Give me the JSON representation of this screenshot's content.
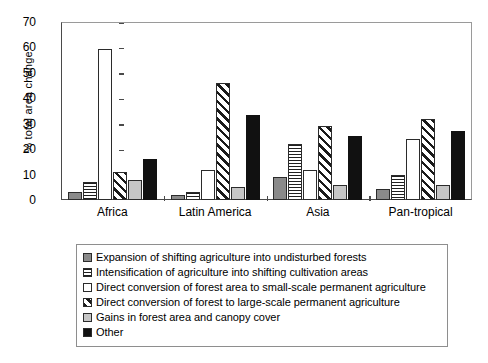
{
  "chart_data": {
    "type": "bar",
    "title": "",
    "xlabel": "",
    "ylabel": "% total area change",
    "ylim": [
      0,
      70
    ],
    "ytick_step": 10,
    "yticks": [
      70,
      60,
      50,
      40,
      30,
      20,
      10,
      0
    ],
    "grid": false,
    "legend_position": "below-plot",
    "categories": [
      "Africa",
      "Latin America",
      "Asia",
      "Pan-tropical"
    ],
    "series": [
      {
        "name": "Expansion of shifting agriculture into undisturbed forests",
        "pattern": "solid-dark-gray",
        "color": "#8a8a8a",
        "values": [
          3,
          2,
          9,
          4.5
        ]
      },
      {
        "name": "Intensification of agriculture into shifting cultivation areas",
        "pattern": "horizontal-lines",
        "color": "#202020",
        "values": [
          7,
          3,
          22,
          10
        ]
      },
      {
        "name": "Direct conversion of forest area to small-scale permanent agriculture",
        "pattern": "solid-white",
        "color": "#ffffff",
        "values": [
          59.5,
          12,
          12,
          24
        ]
      },
      {
        "name": "Direct conversion of forest to large-scale permanent agriculture",
        "pattern": "diagonal-hatch",
        "color": "#1a1a1a",
        "values": [
          11,
          46,
          29,
          32
        ]
      },
      {
        "name": "Gains in forest area and canopy cover",
        "pattern": "solid-light-gray",
        "color": "#c6c6c6",
        "values": [
          8,
          5,
          6,
          6
        ]
      },
      {
        "name": "Other",
        "pattern": "solid-black",
        "color": "#111111",
        "values": [
          16,
          33.5,
          25,
          27
        ]
      }
    ]
  },
  "axis": {
    "y_title": "% total area change",
    "y_tick_0": "0",
    "y_tick_1": "10",
    "y_tick_2": "20",
    "y_tick_3": "30",
    "y_tick_4": "40",
    "y_tick_5": "50",
    "y_tick_6": "60",
    "y_tick_7": "70"
  },
  "x_categories": {
    "c0": "Africa",
    "c1": "Latin America",
    "c2": "Asia",
    "c3": "Pan-tropical"
  },
  "legend": {
    "items": [
      {
        "label": "Expansion of shifting agriculture into undisturbed forests",
        "swatch": "solid-dark-gray"
      },
      {
        "label": "Intensification of agriculture into shifting cultivation areas",
        "swatch": "horizontal-lines"
      },
      {
        "label": "Direct conversion of forest area to small-scale permanent agriculture",
        "swatch": "solid-white"
      },
      {
        "label": "Direct conversion of forest to large-scale permanent agriculture",
        "swatch": "diagonal-hatch"
      },
      {
        "label": "Gains in forest area and canopy cover",
        "swatch": "solid-light-gray"
      },
      {
        "label": "Other",
        "swatch": "solid-black"
      }
    ]
  }
}
